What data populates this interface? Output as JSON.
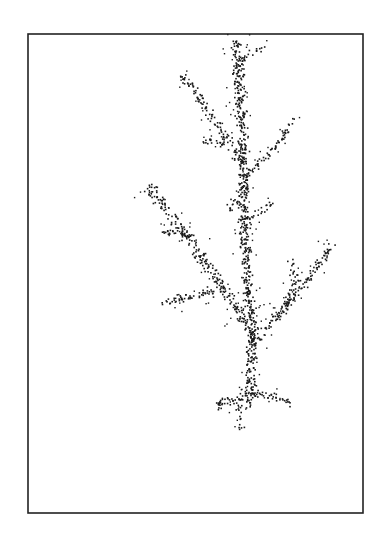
{
  "figure": {
    "type": "diffusion-limited aggregation cluster (dendrite)",
    "frame": {
      "x": 28,
      "y": 34,
      "width": 335,
      "height": 479,
      "stroke": "#222222",
      "stroke_width": 1.6
    },
    "particle_color": "#1a1a1a",
    "background": "#ffffff",
    "branches": [
      {
        "name": "main-trunk",
        "points": [
          [
            248,
            405
          ],
          [
            250,
            370
          ],
          [
            252,
            330
          ],
          [
            248,
            290
          ],
          [
            245,
            250
          ],
          [
            243,
            200
          ],
          [
            243,
            160
          ],
          [
            240,
            110
          ],
          [
            238,
            70
          ],
          [
            236,
            38
          ]
        ],
        "density": 1.0,
        "spread": 5
      },
      {
        "name": "left-main-branch",
        "points": [
          [
            248,
            330
          ],
          [
            232,
            300
          ],
          [
            210,
            270
          ],
          [
            188,
            240
          ],
          [
            170,
            215
          ],
          [
            148,
            185
          ]
        ],
        "density": 0.8,
        "spread": 5
      },
      {
        "name": "left-lower-twig",
        "points": [
          [
            215,
            290
          ],
          [
            195,
            295
          ],
          [
            178,
            298
          ],
          [
            162,
            300
          ]
        ],
        "density": 0.6,
        "spread": 4
      },
      {
        "name": "left-upper-twig",
        "points": [
          [
            190,
            235
          ],
          [
            172,
            230
          ],
          [
            158,
            232
          ]
        ],
        "density": 0.5,
        "spread": 3
      },
      {
        "name": "right-lower-branch",
        "points": [
          [
            252,
            345
          ],
          [
            268,
            325
          ],
          [
            290,
            300
          ],
          [
            310,
            275
          ],
          [
            332,
            243
          ]
        ],
        "density": 0.6,
        "spread": 4
      },
      {
        "name": "right-sub-twig",
        "points": [
          [
            275,
            320
          ],
          [
            288,
            300
          ],
          [
            295,
            280
          ],
          [
            290,
            262
          ]
        ],
        "density": 0.5,
        "spread": 4
      },
      {
        "name": "upper-left-branch",
        "points": [
          [
            242,
            165
          ],
          [
            228,
            140
          ],
          [
            210,
            115
          ],
          [
            195,
            90
          ],
          [
            180,
            72
          ]
        ],
        "density": 0.6,
        "spread": 4
      },
      {
        "name": "upper-left-twig",
        "points": [
          [
            226,
            145
          ],
          [
            210,
            140
          ],
          [
            198,
            142
          ]
        ],
        "density": 0.4,
        "spread": 3
      },
      {
        "name": "upper-right-twig",
        "points": [
          [
            245,
            175
          ],
          [
            262,
            160
          ],
          [
            280,
            140
          ],
          [
            292,
            118
          ]
        ],
        "density": 0.5,
        "spread": 3
      },
      {
        "name": "mid-right-twig",
        "points": [
          [
            248,
            220
          ],
          [
            262,
            210
          ],
          [
            272,
            200
          ]
        ],
        "density": 0.4,
        "spread": 3
      },
      {
        "name": "mid-left-twig",
        "points": [
          [
            245,
            205
          ],
          [
            232,
            200
          ],
          [
            228,
            210
          ]
        ],
        "density": 0.4,
        "spread": 3
      },
      {
        "name": "top-right-twig",
        "points": [
          [
            240,
            60
          ],
          [
            255,
            50
          ],
          [
            266,
            46
          ]
        ],
        "density": 0.4,
        "spread": 3
      },
      {
        "name": "base-left-root",
        "points": [
          [
            245,
            395
          ],
          [
            232,
            400
          ],
          [
            218,
            402
          ],
          [
            220,
            410
          ]
        ],
        "density": 0.7,
        "spread": 4
      },
      {
        "name": "base-right-root",
        "points": [
          [
            250,
            392
          ],
          [
            265,
            395
          ],
          [
            285,
            398
          ],
          [
            290,
            405
          ]
        ],
        "density": 0.5,
        "spread": 3
      },
      {
        "name": "base-tail",
        "points": [
          [
            238,
            405
          ],
          [
            240,
            418
          ],
          [
            242,
            428
          ]
        ],
        "density": 0.4,
        "spread": 3
      }
    ]
  }
}
